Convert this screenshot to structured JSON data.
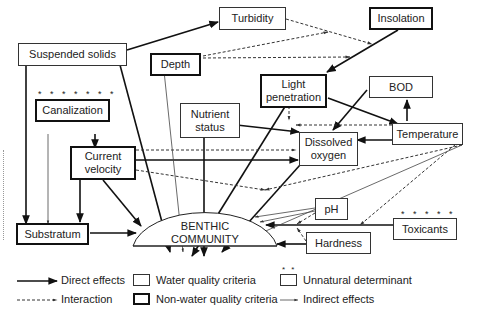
{
  "diagram": {
    "type": "causal-flow",
    "nodes": {
      "suspended_solids": {
        "label": "Suspended solids",
        "kind": "water-quality"
      },
      "turbidity": {
        "label": "Turbidity",
        "kind": "water-quality"
      },
      "insolation": {
        "label": "Insolation",
        "kind": "non-water-quality"
      },
      "depth": {
        "label": "Depth",
        "kind": "non-water-quality"
      },
      "canalization": {
        "label": "Canalization",
        "kind": "non-water-quality",
        "stars": "* * * * * * *"
      },
      "light_penetration": {
        "label": "Light penetration",
        "kind": "non-water-quality"
      },
      "bod": {
        "label": "BOD",
        "kind": "water-quality"
      },
      "nutrient_status": {
        "label": "Nutrient status",
        "kind": "water-quality"
      },
      "temperature": {
        "label": "Temperature",
        "kind": "water-quality"
      },
      "current_velocity": {
        "label": "Current velocity",
        "kind": "non-water-quality"
      },
      "dissolved_oxygen": {
        "label": "Dissolved oxygen",
        "kind": "water-quality"
      },
      "ph": {
        "label": "pH",
        "kind": "water-quality"
      },
      "toxicants": {
        "label": "Toxicants",
        "kind": "water-quality",
        "stars": "* * * * *"
      },
      "substratum": {
        "label": "Substratum",
        "kind": "non-water-quality"
      },
      "hardness": {
        "label": "Hardness",
        "kind": "water-quality"
      },
      "benthic_community": {
        "label_line1": "BENTHIC",
        "label_line2": "COMMUNITY",
        "kind": "target"
      }
    },
    "edges": [
      {
        "from": "Suspended solids",
        "to": "Turbidity",
        "type": "direct"
      },
      {
        "from": "Suspended solids",
        "to": "Substratum",
        "type": "direct"
      },
      {
        "from": "Suspended solids",
        "to": "BENTHIC COMMUNITY",
        "type": "direct"
      },
      {
        "from": "Turbidity",
        "to": "Light penetration",
        "type": "interaction"
      },
      {
        "from": "Depth",
        "to": "Light penetration",
        "type": "interaction"
      },
      {
        "from": "Depth",
        "to": "BENTHIC COMMUNITY",
        "type": "indirect"
      },
      {
        "from": "Insolation",
        "to": "Light penetration",
        "type": "direct"
      },
      {
        "from": "Canalization",
        "to": "Current velocity",
        "type": "direct"
      },
      {
        "from": "Canalization",
        "to": "Substratum",
        "type": "indirect"
      },
      {
        "from": "Light penetration",
        "to": "Temperature",
        "type": "direct"
      },
      {
        "from": "Light penetration",
        "to": "BENTHIC COMMUNITY",
        "type": "direct"
      },
      {
        "from": "BOD",
        "to": "Dissolved oxygen",
        "type": "direct"
      },
      {
        "from": "Temperature",
        "to": "BOD",
        "type": "direct"
      },
      {
        "from": "Temperature",
        "to": "Dissolved oxygen",
        "type": "direct"
      },
      {
        "from": "Temperature",
        "to": "Light penetration / Dissolved oxygen",
        "type": "interaction"
      },
      {
        "from": "Temperature",
        "to": "BENTHIC COMMUNITY",
        "type": "indirect"
      },
      {
        "from": "Temperature",
        "to": "Current velocity link",
        "type": "interaction"
      },
      {
        "from": "Nutrient status",
        "to": "Dissolved oxygen",
        "type": "direct"
      },
      {
        "from": "Nutrient status",
        "to": "BENTHIC COMMUNITY",
        "type": "direct"
      },
      {
        "from": "Current velocity",
        "to": "Nutrient status",
        "type": "interaction"
      },
      {
        "from": "Current velocity",
        "to": "Dissolved oxygen",
        "type": "direct"
      },
      {
        "from": "Current velocity",
        "to": "Substratum",
        "type": "direct"
      },
      {
        "from": "Current velocity",
        "to": "BENTHIC COMMUNITY",
        "type": "direct"
      },
      {
        "from": "Dissolved oxygen",
        "to": "BENTHIC COMMUNITY",
        "type": "direct"
      },
      {
        "from": "pH",
        "to": "BENTHIC COMMUNITY",
        "type": "indirect"
      },
      {
        "from": "Toxicants",
        "to": "BENTHIC COMMUNITY",
        "type": "direct"
      },
      {
        "from": "Toxicants",
        "to": "Temperature link",
        "type": "interaction"
      },
      {
        "from": "Hardness",
        "to": "BENTHIC COMMUNITY",
        "type": "direct"
      },
      {
        "from": "Hardness",
        "to": "Toxicants link",
        "type": "interaction"
      },
      {
        "from": "Substratum",
        "to": "BENTHIC COMMUNITY",
        "type": "direct"
      }
    ]
  },
  "legend": {
    "direct": "Direct effects",
    "interaction": "Interaction",
    "water_quality": "Water quality criteria",
    "non_water_quality": "Non-water quality criteria",
    "unnatural": "Unnatural determinant",
    "unnatural_stars": "* *",
    "indirect": "Indirect effects"
  }
}
